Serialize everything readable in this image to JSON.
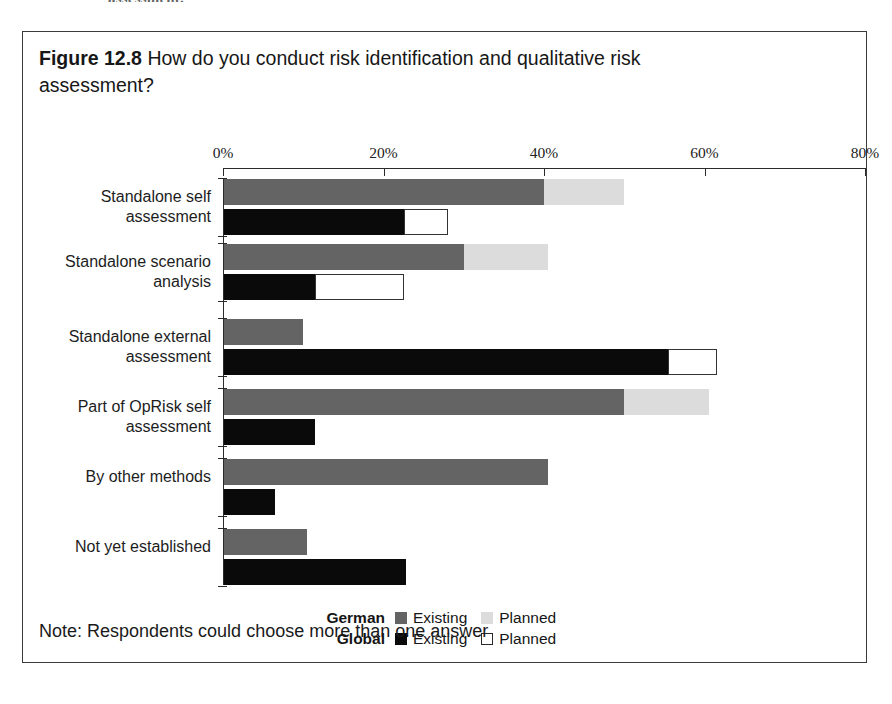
{
  "page_bleed_text": "assessment.",
  "figure": {
    "number": "Figure 12.8",
    "title": "How do you conduct risk identification and qualitative risk assessment?",
    "note": "Note: Respondents could choose more than one answer"
  },
  "legend": {
    "rows": [
      {
        "group": "German",
        "entries": [
          {
            "label": "Existing",
            "swatch": "german-existing",
            "color": "#646464"
          },
          {
            "label": "Planned",
            "swatch": "german-planned",
            "color": "#dcdcdc"
          }
        ]
      },
      {
        "group": "Global",
        "entries": [
          {
            "label": "Existing",
            "swatch": "global-existing",
            "color": "#0a0a0a"
          },
          {
            "label": "Planned",
            "swatch": "global-planned",
            "color": "#ffffff"
          }
        ]
      }
    ]
  },
  "chart_data": {
    "type": "bar",
    "orientation": "horizontal",
    "stacked": true,
    "title": "How do you conduct risk identification and qualitative risk assessment?",
    "xlabel": "",
    "ylabel": "",
    "xlim": [
      0,
      80
    ],
    "xticks": [
      0,
      20,
      40,
      60,
      80
    ],
    "xtick_labels": [
      "0%",
      "20%",
      "40%",
      "60%",
      "80%"
    ],
    "grid": false,
    "legend_position": "bottom-center",
    "note": "Note: Respondents could choose more than one answer",
    "categories": [
      "Standalone self\nassessment",
      "Standalone scenario\nanalysis",
      "Standalone external\nassessment",
      "Part of OpRisk self\nassessment",
      "By other methods",
      "Not yet established"
    ],
    "series": [
      {
        "name": "German Existing",
        "key": "german-existing",
        "values": [
          40.0,
          30.0,
          10.0,
          50.0,
          40.5,
          10.5
        ]
      },
      {
        "name": "German Planned",
        "key": "german-planned",
        "values": [
          10.0,
          10.5,
          0.0,
          10.5,
          0.0,
          0.0
        ]
      },
      {
        "name": "Global Existing",
        "key": "global-existing",
        "values": [
          22.5,
          11.5,
          55.5,
          11.5,
          6.5,
          22.8
        ]
      },
      {
        "name": "Global Planned",
        "key": "global-planned",
        "values": [
          5.5,
          11.0,
          6.0,
          0.0,
          0.0,
          0.0
        ]
      }
    ]
  },
  "geometry": {
    "axis_x0_px": 200,
    "axis_x80_px": 842,
    "axis_y_px": 136,
    "row_tops_px": [
      147,
      212,
      287,
      357,
      427,
      497
    ],
    "row_height_px": 70,
    "bar_height_px": 26,
    "bar_gap_px": 4
  }
}
